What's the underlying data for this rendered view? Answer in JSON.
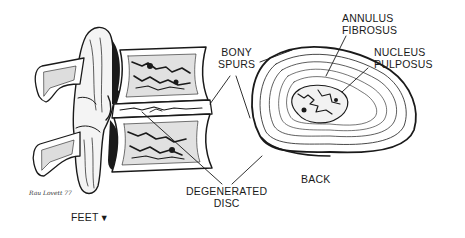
{
  "figure": {
    "type": "anatomical-illustration",
    "colors": {
      "ink": "#1a1a1a",
      "background": "#ffffff"
    }
  },
  "labels": {
    "bony_spurs_line1": "BONY",
    "bony_spurs_line2": "SPURS",
    "annulus_line1": "ANNULUS",
    "annulus_line2": "FIBROSUS",
    "nucleus_line1": "NUCLEUS",
    "nucleus_line2": "PULPOSUS",
    "degenerated_line1": "DEGENERATED",
    "degenerated_line2": "DISC",
    "back": "BACK",
    "feet": "FEET",
    "feet_arrow": "▼",
    "signature": "Rau Lovett 77"
  }
}
